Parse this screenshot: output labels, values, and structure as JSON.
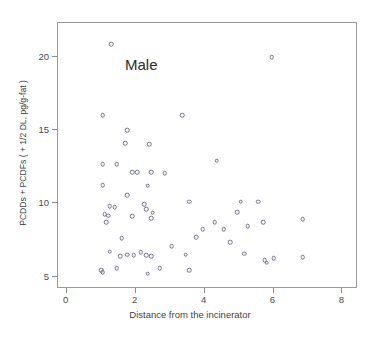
{
  "chart_data": {
    "type": "scatter",
    "title": "",
    "annotation": "Male",
    "xlabel": "Distance from the incinerator",
    "ylabel": "PCDDs + PCDFs ( + 1/2 DL, pg/g-fat )",
    "xlim": [
      -0.25,
      8.45
    ],
    "ylim": [
      4.15,
      22.3
    ],
    "xticks": [
      0,
      2,
      4,
      6,
      8
    ],
    "xticklabels": [
      "0",
      "2",
      "4",
      "6",
      "8"
    ],
    "yticks": [
      5,
      10,
      15,
      20
    ],
    "yticklabels": [
      "5",
      "10",
      "15",
      "20"
    ],
    "grid": false,
    "legend": "none",
    "marker": "open-circle",
    "marker_color": "#6f6f8a",
    "series": [
      {
        "name": "Male",
        "points": [
          [
            1.3,
            20.85
          ],
          [
            5.95,
            19.95
          ],
          [
            1.05,
            16.0
          ],
          [
            3.35,
            16.0
          ],
          [
            1.75,
            15.0
          ],
          [
            1.7,
            14.1
          ],
          [
            2.4,
            14.05
          ],
          [
            1.05,
            12.65
          ],
          [
            1.45,
            12.65
          ],
          [
            1.9,
            12.1
          ],
          [
            2.05,
            12.1
          ],
          [
            2.45,
            12.1
          ],
          [
            2.85,
            12.05
          ],
          [
            4.35,
            12.9
          ],
          [
            1.05,
            11.25
          ],
          [
            2.35,
            11.2
          ],
          [
            1.75,
            10.55
          ],
          [
            3.55,
            10.1
          ],
          [
            1.25,
            9.8
          ],
          [
            1.4,
            9.75
          ],
          [
            2.25,
            9.95
          ],
          [
            2.3,
            9.6
          ],
          [
            2.5,
            9.35
          ],
          [
            5.05,
            10.1
          ],
          [
            5.55,
            10.1
          ],
          [
            1.1,
            9.25
          ],
          [
            1.2,
            9.15
          ],
          [
            1.9,
            9.1
          ],
          [
            2.45,
            9.0
          ],
          [
            4.95,
            9.4
          ],
          [
            6.85,
            8.9
          ],
          [
            1.15,
            8.7
          ],
          [
            4.3,
            8.7
          ],
          [
            5.7,
            8.7
          ],
          [
            3.95,
            8.25
          ],
          [
            4.55,
            8.25
          ],
          [
            5.25,
            8.45
          ],
          [
            1.6,
            7.6
          ],
          [
            3.75,
            7.7
          ],
          [
            4.75,
            7.35
          ],
          [
            1.25,
            6.7
          ],
          [
            1.55,
            6.4
          ],
          [
            1.75,
            6.5
          ],
          [
            1.95,
            6.45
          ],
          [
            2.15,
            6.65
          ],
          [
            2.3,
            6.45
          ],
          [
            2.45,
            6.4
          ],
          [
            3.05,
            7.05
          ],
          [
            3.45,
            6.5
          ],
          [
            5.15,
            6.55
          ],
          [
            5.75,
            6.1
          ],
          [
            5.8,
            5.95
          ],
          [
            6.0,
            6.25
          ],
          [
            6.85,
            6.3
          ],
          [
            1.0,
            5.45
          ],
          [
            1.05,
            5.3
          ],
          [
            1.45,
            5.55
          ],
          [
            2.35,
            5.2
          ],
          [
            2.7,
            5.55
          ],
          [
            3.55,
            5.45
          ]
        ]
      }
    ]
  }
}
